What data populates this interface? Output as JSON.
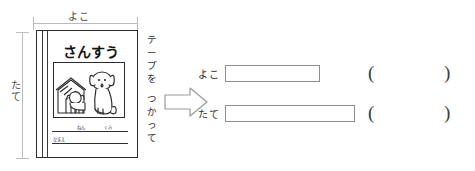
{
  "worksheet": {
    "dimensions": {
      "top_label": "よこ",
      "left_label": "たて"
    },
    "notebook": {
      "title": "さんすう",
      "picture_caption": "dog-and-doghouse-illustration",
      "name_field_nen": "ねん",
      "name_field_kumi": "くみ",
      "name_field_namae": "なまえ"
    },
    "instruction": {
      "line1": "テープを",
      "line2": "つかって",
      "full": "テープを つかって"
    },
    "arrow": {
      "icon": "arrow-right-outline-icon"
    },
    "answers": [
      {
        "label": "よこ",
        "value": "",
        "placeholder": "",
        "unit_open": "(",
        "unit_close": ")",
        "unit_value": ""
      },
      {
        "label": "たて",
        "value": "",
        "placeholder": "",
        "unit_open": "(",
        "unit_close": ")",
        "unit_value": ""
      }
    ],
    "colors": {
      "ink": "#2b2b2b",
      "guide": "#b9b9b9",
      "box_border": "#8e8e8e",
      "background": "#ffffff"
    }
  }
}
